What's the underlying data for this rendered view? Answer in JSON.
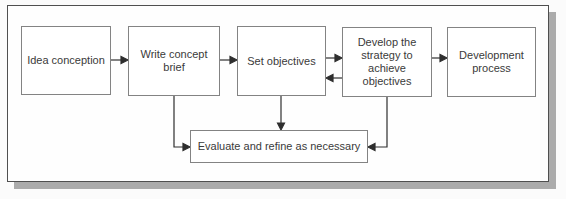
{
  "diagram": {
    "type": "flowchart",
    "colors": {
      "frame_border": "#4f4f4f",
      "frame_shadow": "#ababab",
      "box_border": "#838383",
      "box_fill": "#ffffff",
      "arrow": "#2e2e2e",
      "text": "#3a3a3a",
      "background": "#fefefe"
    },
    "nodes": [
      {
        "id": "idea-conception",
        "label": "Idea conception"
      },
      {
        "id": "write-concept-brief",
        "label": "Write concept brief"
      },
      {
        "id": "set-objectives",
        "label": "Set objectives"
      },
      {
        "id": "develop-strategy",
        "label": "Develop the strategy to achieve objectives"
      },
      {
        "id": "development-process",
        "label": "Development process"
      },
      {
        "id": "evaluate-refine",
        "label": "Evaluate and refine as necessary"
      }
    ],
    "edges": [
      {
        "from": "idea-conception",
        "to": "write-concept-brief"
      },
      {
        "from": "write-concept-brief",
        "to": "set-objectives"
      },
      {
        "from": "set-objectives",
        "to": "develop-strategy"
      },
      {
        "from": "develop-strategy",
        "to": "set-objectives",
        "note": "feedback"
      },
      {
        "from": "develop-strategy",
        "to": "development-process"
      },
      {
        "from": "write-concept-brief",
        "to": "evaluate-refine"
      },
      {
        "from": "set-objectives",
        "to": "evaluate-refine"
      },
      {
        "from": "develop-strategy",
        "to": "evaluate-refine"
      }
    ]
  }
}
